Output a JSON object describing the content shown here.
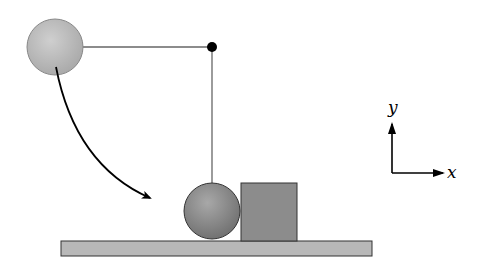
{
  "diagram": {
    "type": "physics-pendulum-collision",
    "colors": {
      "background": "#ffffff",
      "ball_fill_light": "#c4c4c4",
      "ball_fill_dark": "#8a8a8a",
      "ball_outline": "#555555",
      "block_fill": "#8c8c8c",
      "block_outline": "#333333",
      "floor_fill": "#b8b8b8",
      "floor_outline": "#333333",
      "string": "#666666",
      "pivot": "#000000",
      "arrow": "#000000"
    },
    "elements": {
      "ball_initial": {
        "cx": 55,
        "cy": 47,
        "r": 28,
        "label": ""
      },
      "pivot": {
        "cx": 212,
        "cy": 47,
        "r": 5
      },
      "string_horizontal": {
        "x1": 83,
        "y1": 47,
        "x2": 212,
        "y2": 47
      },
      "string_vertical": {
        "x1": 212,
        "y1": 47,
        "x2": 212,
        "y2": 183
      },
      "ball_final": {
        "cx": 212,
        "cy": 211,
        "r": 28
      },
      "block": {
        "x": 241,
        "y": 183,
        "w": 56,
        "h": 58
      },
      "floor": {
        "x": 61,
        "y": 241,
        "w": 311,
        "h": 15
      },
      "swing_arrow": {
        "path": "M 56 67 Q 75 165 150 198"
      }
    },
    "axes": {
      "origin": {
        "x": 392,
        "y": 173
      },
      "x_label": "x",
      "y_label": "y"
    }
  }
}
